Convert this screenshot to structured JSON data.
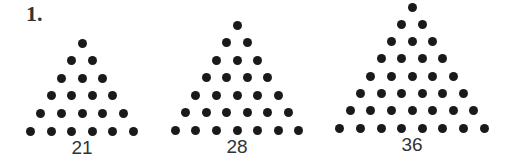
{
  "problem_label": "1.",
  "triangles": [
    {
      "rows": 6,
      "value": "21",
      "apex_x": 82,
      "apex_y": 43,
      "base_y": 131
    },
    {
      "rows": 7,
      "value": "28",
      "apex_x": 237,
      "apex_y": 25,
      "base_y": 130
    },
    {
      "rows": 8,
      "value": "36",
      "apex_x": 412,
      "apex_y": 7,
      "base_y": 128
    }
  ],
  "dot_color": "#1a1a1a"
}
